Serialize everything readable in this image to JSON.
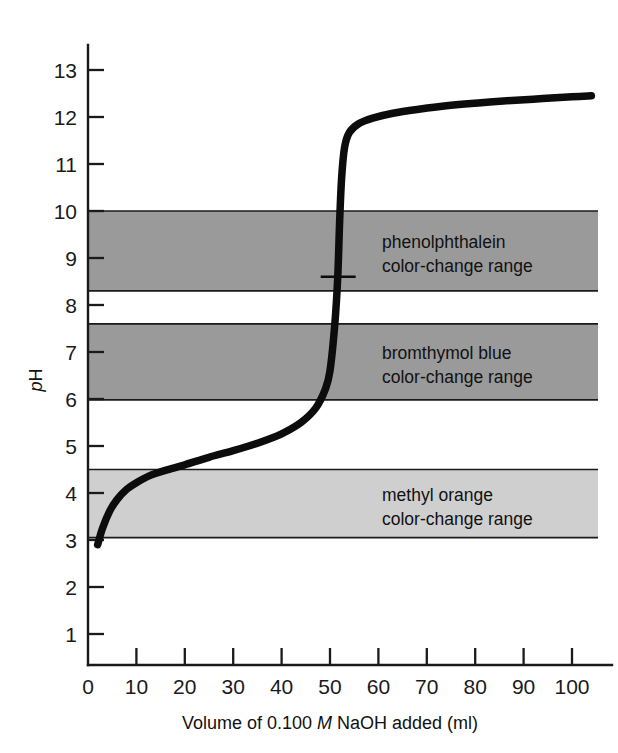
{
  "chart_data": {
    "type": "line",
    "title": "",
    "xlabel": "Volume of 0.100 M NaOH added (ml)",
    "xlabel_parts": {
      "pre": "Volume of 0.100 ",
      "italic": "M",
      "post": " NaOH added (ml)"
    },
    "ylabel": "pH",
    "ylabel_parts": {
      "italic": "p",
      "roman": "H"
    },
    "xlim": [
      0,
      107
    ],
    "ylim": [
      0,
      13.6
    ],
    "xticks": [
      0,
      10,
      20,
      30,
      40,
      50,
      60,
      70,
      80,
      90,
      100
    ],
    "xtick_labels": [
      "0",
      "10",
      "20",
      "30",
      "40",
      "50",
      "60",
      "70",
      "80",
      "90",
      "100"
    ],
    "yticks": [
      1,
      2,
      3,
      4,
      5,
      6,
      7,
      8,
      9,
      10,
      11,
      12,
      13
    ],
    "ytick_labels": [
      "1",
      "2",
      "3",
      "4",
      "5",
      "6",
      "7",
      "8",
      "9",
      "10",
      "11",
      "12",
      "13"
    ],
    "grid": false,
    "legend": "none",
    "series": [
      {
        "name": "titration curve",
        "description": "Titration of a weak acid with 0.100 M NaOH",
        "x": [
          2.0,
          3.0,
          4.5,
          6.0,
          8.0,
          10.0,
          13.0,
          16.0,
          20.0,
          25.0,
          30.0,
          35.0,
          40.0,
          44.0,
          47.0,
          49.0,
          50.0,
          51.0,
          51.6,
          52.0,
          52.4,
          53.0,
          54.0,
          56.0,
          59.0,
          63.0,
          68.0,
          75.0,
          83.0,
          92.0,
          100.0,
          104.0
        ],
        "y": [
          2.9,
          3.25,
          3.62,
          3.86,
          4.08,
          4.22,
          4.38,
          4.48,
          4.6,
          4.76,
          4.9,
          5.06,
          5.26,
          5.5,
          5.8,
          6.2,
          6.6,
          7.6,
          8.6,
          9.8,
          10.7,
          11.35,
          11.67,
          11.86,
          11.98,
          12.08,
          12.16,
          12.25,
          12.32,
          12.38,
          12.43,
          12.45
        ]
      }
    ],
    "equivalence_point": {
      "x": 52.0,
      "y": 8.6,
      "marker": "short-horizontal-tick"
    },
    "bands": [
      {
        "id": "phenolphthalein",
        "label_line1": "phenolphthalein",
        "label_line2": "color-change range",
        "ph_low": 8.3,
        "ph_high": 10.0,
        "color": "#9a9a9a"
      },
      {
        "id": "bromthymol-blue",
        "label_line1": "bromthymol blue",
        "label_line2": "color-change range",
        "ph_low": 5.98,
        "ph_high": 7.6,
        "color": "#9a9a9a"
      },
      {
        "id": "methyl-orange",
        "label_line1": "methyl orange",
        "label_line2": "color-change range",
        "ph_low": 3.05,
        "ph_high": 4.5,
        "color": "#cfcfcf"
      }
    ]
  },
  "colors": {
    "background": "#ffffff",
    "axis": "#1a1a1a",
    "curve": "#0c0c0c",
    "band_dark": "#9a9a9a",
    "band_light": "#cfcfcf"
  }
}
